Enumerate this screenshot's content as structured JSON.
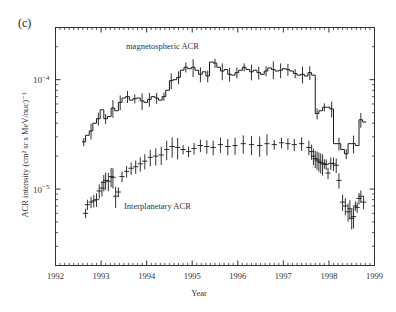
{
  "figure": {
    "panel_label": "(c)",
    "x_title": "Year",
    "y_title": "ACR intensity (cm² sr s MeV/nuc)⁻¹",
    "annotations": {
      "magnetospheric": "magnetospheric ACR",
      "interplanetary": "Interplanetary ACR"
    }
  },
  "chart_data": {
    "type": "line",
    "title": "(c)",
    "xlabel": "Year",
    "ylabel": "ACR intensity (cm² sr s MeV/nuc)⁻¹",
    "xlim": [
      1992,
      1999
    ],
    "ylim": [
      2e-06,
      0.0003
    ],
    "yscale": "log",
    "xscale": "linear",
    "grid": false,
    "legend": "none",
    "xticks": [
      1992,
      1993,
      1994,
      1995,
      1996,
      1997,
      1998,
      1999
    ],
    "xticklabels": [
      "1992",
      "1993",
      "1994",
      "1995",
      "1996",
      "1997",
      "1998",
      "1999"
    ],
    "yticks": [
      1e-05,
      0.0001
    ],
    "yticklabels": [
      "10⁻⁵",
      "10⁻⁴"
    ],
    "minor_ticks": true,
    "series": [
      {
        "name": "magnetospheric ACR",
        "style": "step-histogram-with-errorbars",
        "color": "#1a1a1a",
        "x": [
          1992.62,
          1992.7,
          1992.78,
          1992.86,
          1992.94,
          1993.02,
          1993.1,
          1993.18,
          1993.26,
          1993.34,
          1993.42,
          1993.5,
          1993.58,
          1993.66,
          1993.74,
          1993.82,
          1993.9,
          1993.98,
          1994.06,
          1994.14,
          1994.22,
          1994.3,
          1994.38,
          1994.46,
          1994.54,
          1994.62,
          1994.7,
          1994.78,
          1994.86,
          1994.94,
          1995.02,
          1995.1,
          1995.18,
          1995.26,
          1995.34,
          1995.42,
          1995.5,
          1995.58,
          1995.66,
          1995.74,
          1995.82,
          1995.9,
          1995.98,
          1996.06,
          1996.14,
          1996.22,
          1996.3,
          1996.38,
          1996.46,
          1996.54,
          1996.62,
          1996.7,
          1996.78,
          1996.86,
          1996.94,
          1997.02,
          1997.1,
          1997.18,
          1997.26,
          1997.34,
          1997.42,
          1997.5,
          1997.58,
          1997.66,
          1997.74,
          1997.82,
          1997.9,
          1997.98,
          1998.06,
          1998.14,
          1998.22,
          1998.3,
          1998.38,
          1998.46,
          1998.54,
          1998.62,
          1998.7,
          1998.78
        ],
        "y": [
          2.7e-05,
          3.1e-05,
          3.4e-05,
          4e-05,
          4.4e-05,
          5.3e-05,
          4.4e-05,
          4.6e-05,
          5.5e-05,
          5.2e-05,
          6.2e-05,
          6.8e-05,
          7e-05,
          6.5e-05,
          6.7e-05,
          6.8e-05,
          6.4e-05,
          6.2e-05,
          6.6e-05,
          7e-05,
          6.8e-05,
          6.5e-05,
          7e-05,
          8e-05,
          9.8e-05,
          0.0001,
          0.000105,
          0.000122,
          0.00013,
          0.000126,
          0.00013,
          0.000122,
          0.000112,
          0.000118,
          0.000108,
          0.000145,
          0.000142,
          0.00013,
          0.00012,
          0.000124,
          0.000112,
          0.00011,
          0.000116,
          0.000122,
          0.00013,
          0.000124,
          0.000118,
          0.000122,
          0.000116,
          0.000112,
          0.00012,
          0.000128,
          0.000124,
          0.00012,
          0.000122,
          0.000126,
          0.000124,
          0.00012,
          0.000114,
          0.00011,
          0.000112,
          0.000108,
          0.000116,
          0.00011,
          4.9e-05,
          5.2e-05,
          5.6e-05,
          5.6e-05,
          5.4e-05,
          2.6e-05,
          2.6e-05,
          2.3e-05,
          2.1e-05,
          2.6e-05,
          2.6e-05,
          2.5e-05,
          4.3e-05,
          4.1e-05
        ]
      },
      {
        "name": "Interplanetary ACR",
        "style": "points-with-errorbars",
        "color": "#1a1a1a",
        "x": [
          1992.66,
          1992.7,
          1992.78,
          1992.84,
          1992.9,
          1992.96,
          1993.02,
          1993.06,
          1993.1,
          1993.16,
          1993.22,
          1993.26,
          1993.32,
          1993.38,
          1993.46,
          1993.56,
          1993.66,
          1993.76,
          1993.86,
          1993.96,
          1994.08,
          1994.2,
          1994.32,
          1994.44,
          1994.56,
          1994.68,
          1994.8,
          1994.92,
          1995.04,
          1995.18,
          1995.32,
          1995.46,
          1995.62,
          1995.78,
          1995.94,
          1996.12,
          1996.3,
          1996.48,
          1996.64,
          1996.8,
          1996.96,
          1997.1,
          1997.24,
          1997.4,
          1997.56,
          1997.62,
          1997.66,
          1997.7,
          1997.74,
          1997.78,
          1997.82,
          1997.86,
          1997.9,
          1997.94,
          1997.98,
          1998.04,
          1998.1,
          1998.16,
          1998.22,
          1998.3,
          1998.36,
          1998.42,
          1998.46,
          1998.5,
          1998.54,
          1998.58,
          1998.62,
          1998.66,
          1998.7,
          1998.76
        ],
        "y": [
          6e-06,
          7.2e-06,
          7.6e-06,
          7.8e-06,
          8e-06,
          9.6e-06,
          1.02e-05,
          1.15e-05,
          1.2e-05,
          1.18e-05,
          1.3e-05,
          1.28e-05,
          8.6e-06,
          9.4e-06,
          1.3e-05,
          1.45e-05,
          1.55e-05,
          1.6e-05,
          1.7e-05,
          1.8e-05,
          1.95e-05,
          2e-05,
          2.05e-05,
          2.3e-05,
          2.45e-05,
          2.4e-05,
          2.3e-05,
          2.2e-05,
          2.35e-05,
          2.5e-05,
          2.45e-05,
          2.4e-05,
          2.55e-05,
          2.45e-05,
          2.5e-05,
          2.6e-05,
          2.55e-05,
          2.5e-05,
          2.6e-05,
          2.55e-05,
          2.65e-05,
          2.6e-05,
          2.55e-05,
          2.6e-05,
          2.4e-05,
          2.2e-05,
          2e-05,
          1.9e-05,
          1.85e-05,
          1.8e-05,
          1.75e-05,
          1.7e-05,
          1.7e-05,
          1.68e-05,
          1.4e-05,
          1.72e-05,
          1.7e-05,
          1.65e-05,
          1.2e-05,
          7.6e-06,
          7e-06,
          6.2e-06,
          6.6e-06,
          5.4e-06,
          5.6e-06,
          7e-06,
          6.8e-06,
          8.2e-06,
          8.6e-06,
          7.6e-06
        ]
      }
    ]
  }
}
